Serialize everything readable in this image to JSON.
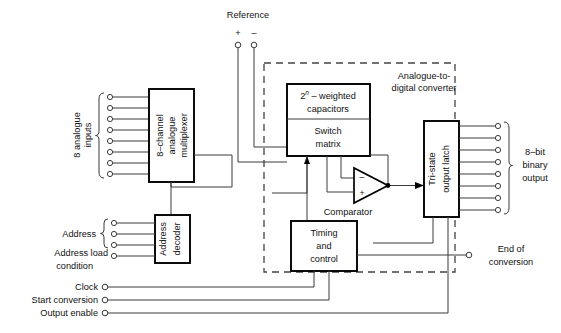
{
  "diagram": {
    "enclosure_label_line1": "Analogue-to-",
    "enclosure_label_line2": "digital converter"
  },
  "blocks": {
    "multiplexer": {
      "line1": "8–channel",
      "line2": "analogue",
      "line3": "multiplexer"
    },
    "capacitors": {
      "line1_pre": "2",
      "line1_sup": "n",
      "line1_post": " – weighted",
      "line2": "capacitors"
    },
    "switch_matrix": {
      "line1": "Switch",
      "line2": "matrix"
    },
    "address_decoder": {
      "line1": "Address",
      "line2": "decoder"
    },
    "timing_control": {
      "line1": "Timing",
      "line2": "and",
      "line3": "control"
    },
    "output_latch": {
      "line1": "Tri-state",
      "line2": "output latch"
    },
    "comparator": {
      "label": "Comparator",
      "minus": "–",
      "plus": "+"
    }
  },
  "io_labels": {
    "reference": "Reference",
    "reference_plus": "+",
    "reference_minus": "–",
    "analogue_inputs_line1": "8 analogue",
    "analogue_inputs_line2": "inputs",
    "address": "Address",
    "address_load_line1": "Address load",
    "address_load_line2": "condition",
    "clock": "Clock",
    "start_conversion": "Start conversion",
    "output_enable": "Output enable",
    "end_of_conversion_line1": "End of",
    "end_of_conversion_line2": "conversion",
    "binary_output_line1": "8–bit",
    "binary_output_line2": "binary",
    "binary_output_line3": "output"
  },
  "counts": {
    "analogue_input_lines": 8,
    "address_lines": 3,
    "binary_output_lines": 8
  },
  "colors": {
    "background": "#ffffff",
    "wire": "#3a3a3a",
    "box_border": "#000000",
    "dashed_border": "#444444",
    "text": "#111111"
  }
}
